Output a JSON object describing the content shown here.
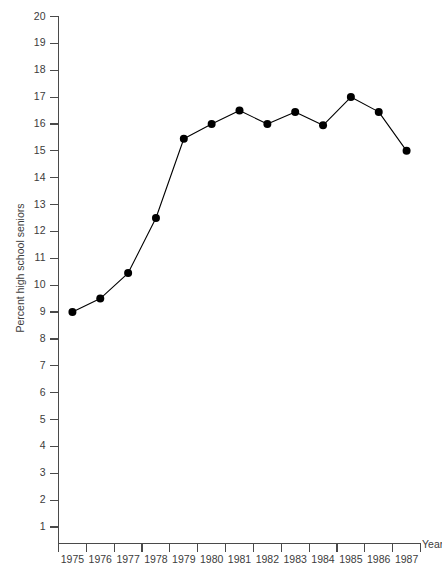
{
  "chart_data": {
    "type": "line",
    "title": "",
    "subtitle": "",
    "xlabel": "Year",
    "ylabel": "Percent high school seniors",
    "categories": [
      "1975",
      "1976",
      "1977",
      "1978",
      "1979",
      "1980",
      "1981",
      "1982",
      "1983",
      "1984",
      "1985",
      "1986",
      "1987"
    ],
    "x": [
      1975,
      1976,
      1977,
      1978,
      1979,
      1980,
      1981,
      1982,
      1983,
      1984,
      1985,
      1986,
      1987
    ],
    "values": [
      9.0,
      9.5,
      10.45,
      12.5,
      15.45,
      16.0,
      16.5,
      16.0,
      16.45,
      15.95,
      17.0,
      16.45,
      15.0
    ],
    "series": [
      {
        "name": "Percent high school seniors",
        "values": [
          9.0,
          9.5,
          10.45,
          12.5,
          15.45,
          16.0,
          16.5,
          16.0,
          16.45,
          15.95,
          17.0,
          16.45,
          15.0
        ]
      }
    ],
    "ylim": [
      0,
      20
    ],
    "xlim": [
      1974.5,
      1987.5
    ],
    "y_ticks": [
      1,
      2,
      3,
      4,
      5,
      6,
      7,
      8,
      9,
      10,
      11,
      12,
      13,
      14,
      15,
      16,
      17,
      18,
      19,
      20
    ],
    "y_tick_labels": [
      "1",
      "2",
      "3",
      "4",
      "5",
      "6",
      "7",
      "8",
      "9",
      "10",
      "11",
      "12",
      "13",
      "14",
      "15",
      "16",
      "17",
      "18",
      "19",
      "20"
    ],
    "x_tick_labels": [
      "1975",
      "1976",
      "1977",
      "1978",
      "1979",
      "1980",
      "1981",
      "1982",
      "1983",
      "1984",
      "1985",
      "1986",
      "1987"
    ],
    "grid": false,
    "legend": false,
    "legend_position": "none",
    "marker": "filled-circle",
    "line_color": "#000000",
    "marker_color": "#000000",
    "axis_color": "#4a4a4a",
    "text_color": "#3c3c3c",
    "background_color": "#ffffff"
  },
  "axis_titles": {
    "y": "Percent high school seniors",
    "x": "Year"
  }
}
